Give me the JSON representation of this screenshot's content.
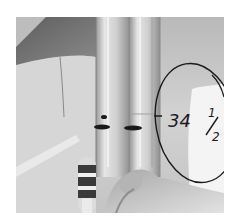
{
  "image": {
    "kind": "grayscale photograph",
    "subject": "glass tubes held by a hand with handwritten measurement annotation",
    "annotation": {
      "text": "34 1/2",
      "whole": "34",
      "fraction_numerator": "1",
      "fraction_denominator": "2",
      "circled": true
    },
    "colors": {
      "background": "#ffffff",
      "sleeve_dark": "#6e6e6e",
      "wall_mid": "#bdbdbd",
      "wall_light": "#d8d8d8",
      "highlight": "#f4f4f4",
      "ink": "#1a1a1a",
      "marker_band_dark": "#3a3a3a",
      "skin": "#cfcfcf"
    }
  }
}
